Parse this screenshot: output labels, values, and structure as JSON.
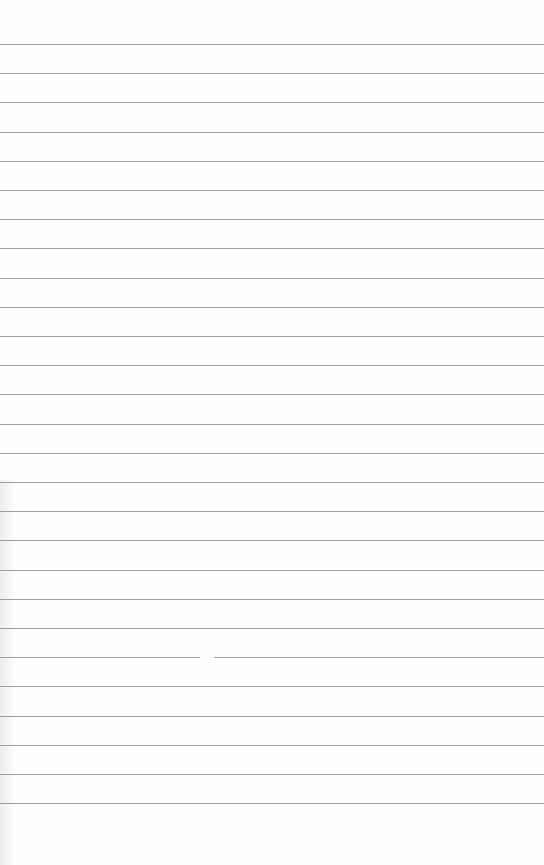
{
  "page": {
    "type": "lined-paper",
    "background_color": "#fefefe",
    "line_color": "#8e8e8e",
    "line_count": 27,
    "first_line_y": 44,
    "line_spacing": 29.2,
    "text": ""
  }
}
